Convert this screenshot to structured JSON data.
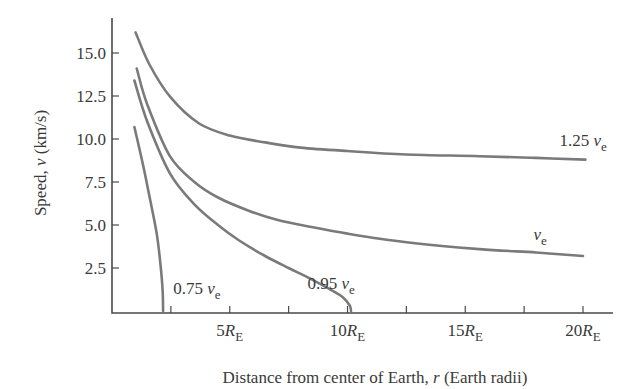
{
  "chart_data": {
    "type": "line",
    "title": "",
    "xlabel": "Distance from center of Earth, r (Earth radii)",
    "xlabel_parts": {
      "prefix": "Distance from center of Earth, ",
      "var": "r",
      "suffix": " (Earth radii)"
    },
    "ylabel": "Speed, v (km/s)",
    "ylabel_parts": {
      "prefix": "Speed, ",
      "var": "v",
      "suffix": " (km/s)"
    },
    "xlim": [
      0,
      21.3
    ],
    "ylim": [
      0,
      17.5
    ],
    "grid": false,
    "x_ticks": [
      2.5,
      5,
      7.5,
      10,
      12.5,
      15,
      17.5,
      20
    ],
    "x_tick_labels": [
      {
        "value": 5,
        "num": "5",
        "unit": "R",
        "sub": "E"
      },
      {
        "value": 10,
        "num": "10",
        "unit": "R",
        "sub": "E"
      },
      {
        "value": 15,
        "num": "15",
        "unit": "R",
        "sub": "E"
      },
      {
        "value": 20,
        "num": "20",
        "unit": "R",
        "sub": "E"
      }
    ],
    "y_ticks": [
      2.5,
      5.0,
      7.5,
      10.0,
      12.5,
      15.0
    ],
    "y_tick_labels": [
      "2.5",
      "5.0",
      "7.5",
      "10.0",
      "12.5",
      "15.0"
    ],
    "series": [
      {
        "name": "1.25 v_e",
        "label_num": "1.25 ",
        "label_var": "v",
        "label_sub": "e",
        "label_pos": [
          19.0,
          9.6
        ],
        "x": [
          1.0,
          1.6,
          2.5,
          3.7,
          5.0,
          6.5,
          8.0,
          10.0,
          12.5,
          15.6,
          18.0,
          20.1
        ],
        "y": [
          16.2,
          14.3,
          12.4,
          10.9,
          10.2,
          9.8,
          9.5,
          9.3,
          9.1,
          9.0,
          8.9,
          8.8
        ]
      },
      {
        "name": "v_e",
        "label_num": "",
        "label_var": "v",
        "label_sub": "e",
        "label_pos": [
          17.9,
          4.1
        ],
        "x": [
          1.05,
          1.5,
          2.46,
          3.5,
          4.5,
          5.86,
          7.0,
          8.4,
          10.0,
          12.5,
          15.6,
          18.0,
          20.0
        ],
        "y": [
          14.1,
          12.0,
          9.0,
          7.5,
          6.6,
          5.8,
          5.3,
          4.9,
          4.5,
          4.0,
          3.6,
          3.4,
          3.2
        ]
      },
      {
        "name": "0.95 v_e",
        "label_num": "0.95 ",
        "label_var": "v",
        "label_sub": "e",
        "label_pos": [
          8.3,
          1.3
        ],
        "x": [
          0.95,
          1.5,
          2.46,
          3.5,
          4.5,
          5.4,
          6.5,
          7.5,
          8.4,
          9.2,
          9.8,
          10.1,
          10.15
        ],
        "y": [
          13.4,
          11.0,
          8.0,
          6.2,
          5.0,
          4.1,
          3.2,
          2.5,
          1.9,
          1.3,
          0.8,
          0.3,
          0.0
        ]
      },
      {
        "name": "0.75 v_e",
        "label_num": "0.75 ",
        "label_var": "v",
        "label_sub": "e",
        "label_pos": [
          2.6,
          1.0
        ],
        "x": [
          0.95,
          1.3,
          1.6,
          1.9,
          2.05,
          2.15,
          2.17
        ],
        "y": [
          10.7,
          8.6,
          6.6,
          4.5,
          2.8,
          1.2,
          0.0
        ]
      }
    ]
  }
}
